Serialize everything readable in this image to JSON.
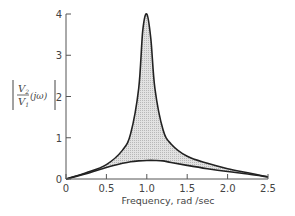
{
  "chart_data": {
    "type": "line",
    "title": "",
    "xlabel": "Frequency, rad/sec",
    "ylabel": "|V2/V1(jω)|",
    "xlim": [
      0,
      2.5
    ],
    "ylim": [
      0,
      4
    ],
    "x_ticks": [
      "0",
      "0.5",
      "1.0",
      "1.5",
      "2.0",
      "2.5"
    ],
    "y_ticks": [
      "0",
      "1",
      "2",
      "3",
      "4"
    ],
    "grid": false,
    "legend": null,
    "fill_between_series": true,
    "fill_color": "#d4d4d4",
    "line_color": "#222222",
    "series": [
      {
        "name": "upper envelope",
        "x": [
          0,
          0.25,
          0.5,
          0.7,
          0.8,
          0.9,
          0.95,
          1.0,
          1.05,
          1.1,
          1.2,
          1.3,
          1.5,
          1.75,
          2.0,
          2.25,
          2.5
        ],
        "values": [
          0,
          0.15,
          0.35,
          0.7,
          1.1,
          2.2,
          3.6,
          4.0,
          3.4,
          2.2,
          1.2,
          0.85,
          0.55,
          0.38,
          0.25,
          0.15,
          0.05
        ]
      },
      {
        "name": "lower envelope",
        "x": [
          0,
          0.25,
          0.5,
          0.7,
          0.8,
          0.9,
          1.0,
          1.1,
          1.2,
          1.3,
          1.5,
          1.75,
          2.0,
          2.25,
          2.5
        ],
        "values": [
          0,
          0.13,
          0.28,
          0.38,
          0.42,
          0.44,
          0.45,
          0.45,
          0.44,
          0.4,
          0.33,
          0.25,
          0.18,
          0.12,
          0.05
        ]
      }
    ]
  },
  "labels": {
    "x_axis_title": "Frequency,  rad /sec",
    "y_axis_num": "V",
    "y_axis_num_sub": "2",
    "y_axis_den": "V",
    "y_axis_den_sub": "1",
    "y_axis_arg": "(jω)"
  }
}
